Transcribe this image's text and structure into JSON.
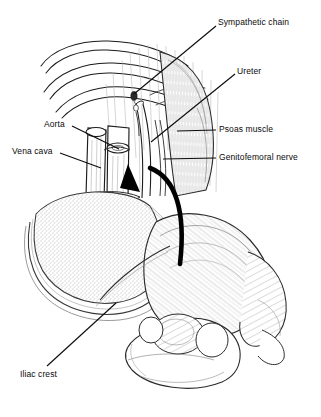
{
  "figure": {
    "background_color": "#ffffff",
    "ink_color": "#111111",
    "width": 321,
    "height": 417
  },
  "labels": [
    {
      "id": "sympathetic-chain",
      "text": "Sympathetic chain",
      "x": 218,
      "y": 18,
      "align": "left"
    },
    {
      "id": "ureter",
      "text": "Ureter",
      "x": 237,
      "y": 67,
      "align": "left"
    },
    {
      "id": "psoas-muscle",
      "text": "Psoas muscle",
      "x": 219,
      "y": 125,
      "align": "left"
    },
    {
      "id": "genitofemoral-nerve",
      "text": "Genitofemoral nerve",
      "x": 219,
      "y": 153,
      "align": "left"
    },
    {
      "id": "aorta",
      "text": "Aorta",
      "x": 44,
      "y": 120,
      "align": "left"
    },
    {
      "id": "vena-cava",
      "text": "Vena cava",
      "x": 12,
      "y": 147,
      "align": "left"
    },
    {
      "id": "iliac-crest",
      "text": "Iliac crest",
      "x": 20,
      "y": 370,
      "align": "left"
    }
  ],
  "leader_lines": [
    {
      "id": "leader-sympathetic-chain",
      "from": [
        216,
        26
      ],
      "to": [
        134,
        94
      ]
    },
    {
      "id": "leader-ureter",
      "from": [
        235,
        74
      ],
      "to": [
        151,
        142
      ]
    },
    {
      "id": "leader-psoas-muscle",
      "from": [
        216,
        130
      ],
      "to": [
        177,
        131
      ]
    },
    {
      "id": "leader-genitofemoral-nerve",
      "from": [
        216,
        158
      ],
      "to": [
        163,
        159
      ]
    },
    {
      "id": "leader-aorta",
      "from": [
        72,
        126
      ],
      "to": [
        119,
        149
      ]
    },
    {
      "id": "leader-vena-cava",
      "from": [
        60,
        153
      ],
      "to": [
        101,
        168
      ]
    },
    {
      "id": "leader-iliac-crest",
      "from": [
        47,
        366
      ],
      "to": [
        116,
        303
      ]
    }
  ],
  "anatomy": {
    "ribs": "three curved lower ribs, upper left",
    "vessels": "aorta and inferior vena cava, vertical tubes at center",
    "ureter": "narrow tube descending right of vessels",
    "psoas": "striated muscle belly, right of midline",
    "kidney_mass": "large stippled oval retroperitoneal mass, left",
    "pelvis": "hatched iliac wing, iliac crest and sacrum, lower right",
    "arrow": "thick black curved surgical approach arrow"
  }
}
